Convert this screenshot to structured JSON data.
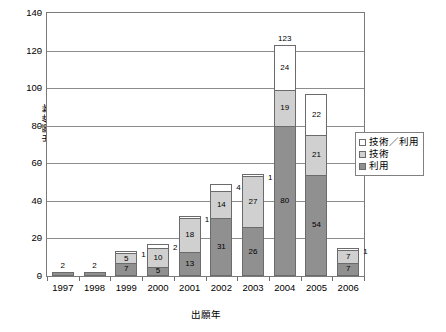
{
  "chart_data": {
    "type": "bar",
    "subtype": "stacked-vertical",
    "title": "",
    "xlabel": "出願年",
    "ylabel": "出願件数",
    "ylim": [
      0,
      140
    ],
    "ytick_step": 20,
    "yticks": [
      0,
      20,
      40,
      60,
      80,
      100,
      120,
      140
    ],
    "grid": true,
    "legend_position": "right",
    "categories": [
      "1997",
      "1998",
      "1999",
      "2000",
      "2001",
      "2002",
      "2003",
      "2004",
      "2005",
      "2006"
    ],
    "series": [
      {
        "name": "利用",
        "color": "#909090",
        "values": [
          2,
          2,
          7,
          5,
          13,
          31,
          26,
          80,
          54,
          7
        ]
      },
      {
        "name": "技術",
        "color": "#d0d0d0",
        "values": [
          0,
          0,
          5,
          10,
          18,
          14,
          27,
          19,
          21,
          7
        ]
      },
      {
        "name": "技術／利用",
        "color": "#ffffff",
        "values": [
          0,
          0,
          1,
          2,
          1,
          4,
          1,
          24,
          22,
          1
        ]
      }
    ],
    "bars": [
      {
        "year": "1997",
        "total": 2,
        "total_label": "2",
        "show_total": true,
        "segments": [
          {
            "series": "利用",
            "value": 2,
            "label": "2",
            "label_inside": false,
            "label_shown": false
          },
          {
            "series": "技術",
            "value": 0,
            "label": "",
            "label_inside": false,
            "label_shown": false
          },
          {
            "series": "技術／利用",
            "value": 0,
            "label": "",
            "label_inside": false,
            "label_shown": false
          }
        ]
      },
      {
        "year": "1998",
        "total": 2,
        "total_label": "2",
        "show_total": true,
        "segments": [
          {
            "series": "利用",
            "value": 2,
            "label": "2",
            "label_inside": false,
            "label_shown": false
          },
          {
            "series": "技術",
            "value": 0,
            "label": "",
            "label_inside": false,
            "label_shown": false
          },
          {
            "series": "技術／利用",
            "value": 0,
            "label": "",
            "label_inside": false,
            "label_shown": false
          }
        ]
      },
      {
        "year": "1999",
        "total": 13,
        "total_label": "",
        "show_total": false,
        "segments": [
          {
            "series": "利用",
            "value": 7,
            "label": "7",
            "label_inside": true,
            "label_shown": true
          },
          {
            "series": "技術",
            "value": 5,
            "label": "5",
            "label_inside": true,
            "label_shown": true
          },
          {
            "series": "技術／利用",
            "value": 1,
            "label": "1",
            "label_inside": false,
            "label_shown": true
          }
        ]
      },
      {
        "year": "2000",
        "total": 17,
        "total_label": "",
        "show_total": false,
        "segments": [
          {
            "series": "利用",
            "value": 5,
            "label": "5",
            "label_inside": true,
            "label_shown": true
          },
          {
            "series": "技術",
            "value": 10,
            "label": "10",
            "label_inside": true,
            "label_shown": true
          },
          {
            "series": "技術／利用",
            "value": 2,
            "label": "2",
            "label_inside": false,
            "label_shown": true
          }
        ]
      },
      {
        "year": "2001",
        "total": 32,
        "total_label": "",
        "show_total": false,
        "segments": [
          {
            "series": "利用",
            "value": 13,
            "label": "13",
            "label_inside": true,
            "label_shown": true
          },
          {
            "series": "技術",
            "value": 18,
            "label": "18",
            "label_inside": true,
            "label_shown": true
          },
          {
            "series": "技術／利用",
            "value": 1,
            "label": "1",
            "label_inside": false,
            "label_shown": true
          }
        ]
      },
      {
        "year": "2002",
        "total": 49,
        "total_label": "",
        "show_total": false,
        "segments": [
          {
            "series": "利用",
            "value": 31,
            "label": "31",
            "label_inside": true,
            "label_shown": true
          },
          {
            "series": "技術",
            "value": 14,
            "label": "14",
            "label_inside": true,
            "label_shown": true
          },
          {
            "series": "技術／利用",
            "value": 4,
            "label": "4",
            "label_inside": false,
            "label_shown": true
          }
        ]
      },
      {
        "year": "2003",
        "total": 54,
        "total_label": "",
        "show_total": false,
        "segments": [
          {
            "series": "利用",
            "value": 26,
            "label": "26",
            "label_inside": true,
            "label_shown": true
          },
          {
            "series": "技術",
            "value": 27,
            "label": "27",
            "label_inside": true,
            "label_shown": true
          },
          {
            "series": "技術／利用",
            "value": 1,
            "label": "1",
            "label_inside": false,
            "label_shown": true
          }
        ]
      },
      {
        "year": "2004",
        "total": 123,
        "total_label": "123",
        "show_total": true,
        "segments": [
          {
            "series": "利用",
            "value": 80,
            "label": "80",
            "label_inside": true,
            "label_shown": true
          },
          {
            "series": "技術",
            "value": 19,
            "label": "19",
            "label_inside": true,
            "label_shown": true
          },
          {
            "series": "技術／利用",
            "value": 24,
            "label": "24",
            "label_inside": true,
            "label_shown": true
          }
        ]
      },
      {
        "year": "2005",
        "total": 97,
        "total_label": "",
        "show_total": false,
        "segments": [
          {
            "series": "利用",
            "value": 54,
            "label": "54",
            "label_inside": true,
            "label_shown": true
          },
          {
            "series": "技術",
            "value": 21,
            "label": "21",
            "label_inside": true,
            "label_shown": true
          },
          {
            "series": "技術／利用",
            "value": 22,
            "label": "22",
            "label_inside": true,
            "label_shown": true
          }
        ]
      },
      {
        "year": "2006",
        "total": 15,
        "total_label": "",
        "show_total": false,
        "segments": [
          {
            "series": "利用",
            "value": 7,
            "label": "7",
            "label_inside": true,
            "label_shown": true
          },
          {
            "series": "技術",
            "value": 7,
            "label": "7",
            "label_inside": true,
            "label_shown": true
          },
          {
            "series": "技術／利用",
            "value": 1,
            "label": "1",
            "label_inside": false,
            "label_shown": true
          }
        ]
      }
    ],
    "legend": [
      {
        "label": "技術／利用",
        "color": "#ffffff",
        "swatch_class": "sw-both"
      },
      {
        "label": "技術",
        "color": "#d0d0d0",
        "swatch_class": "sw-gijutsu"
      },
      {
        "label": "利用",
        "color": "#909090",
        "swatch_class": "sw-riyou"
      }
    ]
  }
}
